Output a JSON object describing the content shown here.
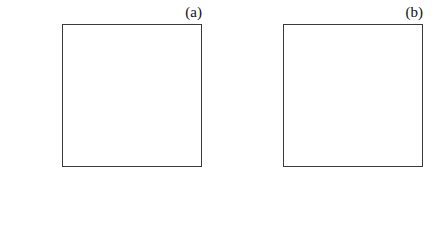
{
  "figure": {
    "background": "#ffffff",
    "line_color": "#2b2b2b",
    "axis_color": "#3a3a3a"
  },
  "chart_data": [
    {
      "id": "panel-a",
      "type": "line",
      "title": "(a)",
      "panel_label": "(a)",
      "xlabel": "Profit",
      "xlabel_sub": "2",
      "xlabel_symbol": "π",
      "ylabel": "Utility",
      "ylabel_symbol": "U",
      "ylabel_sub": "1",
      "xlim": [
        0,
        5
      ],
      "ylim": [
        -4,
        3
      ],
      "xticks": [
        "0",
        "1",
        "2",
        "3",
        "4",
        "5"
      ],
      "xtick_values": [
        0,
        1,
        2,
        3,
        4,
        5
      ],
      "yticks": [
        "3",
        "2",
        "1",
        "0",
        "-1",
        "-2",
        "-3",
        "-4"
      ],
      "ytick_values": [
        3,
        2,
        1,
        0,
        -1,
        -2,
        -3,
        -4
      ],
      "grid": false,
      "legend": "none",
      "markers": false,
      "series": [
        {
          "name": "solid",
          "style": "solid",
          "x": [
            0,
            0.5,
            5
          ],
          "values": [
            0.25,
            0.5,
            -4.0
          ]
        },
        {
          "name": "long-dash",
          "style": "long-dash",
          "x": [
            0,
            1,
            5
          ],
          "values": [
            0.6,
            1.0,
            -2.8
          ]
        },
        {
          "name": "short-dash",
          "style": "short-dash",
          "x": [
            0,
            2,
            5
          ],
          "values": [
            1.0,
            2.0,
            -1.0
          ]
        }
      ]
    },
    {
      "id": "panel-b",
      "type": "line",
      "title": "(b)",
      "panel_label": "(b)",
      "xlabel": "Profit",
      "xlabel_sub": "1",
      "xlabel_symbol": "π",
      "ylabel": "Utility",
      "ylabel_symbol": "U",
      "ylabel_sub": "1",
      "xlim": [
        0,
        4
      ],
      "ylim": [
        -4,
        6
      ],
      "xticks": [
        "0",
        "1",
        "2",
        "3",
        "4"
      ],
      "xtick_values": [
        0,
        1,
        2,
        3,
        4
      ],
      "yticks": [
        "6",
        "4",
        "2",
        "0",
        "-2",
        "-4"
      ],
      "ytick_values": [
        6,
        4,
        2,
        0,
        -2,
        -4
      ],
      "grid": false,
      "legend": "none",
      "markers": true,
      "series": [
        {
          "name": "solid-markers",
          "style": "solid",
          "marker": "filled-circle",
          "x": [
            0,
            1,
            2,
            3,
            4
          ],
          "values": [
            0,
            1,
            2,
            3,
            4
          ]
        },
        {
          "name": "solid-concave",
          "style": "solid",
          "marker": "none",
          "x": [
            0,
            1,
            2,
            3,
            4
          ],
          "values": [
            -0.5,
            0.85,
            1.5,
            1.95,
            2.2
          ]
        },
        {
          "name": "long-dash",
          "style": "long-dash",
          "marker": "none",
          "x": [
            0,
            1,
            2,
            3,
            4
          ],
          "values": [
            -1.0,
            0.6,
            1.55,
            2.05,
            2.45
          ]
        },
        {
          "name": "short-dash",
          "style": "short-dash",
          "marker": "none",
          "x": [
            0,
            1,
            2,
            3,
            4
          ],
          "values": [
            -2.0,
            0.2,
            2.0,
            2.6,
            3.0
          ]
        }
      ]
    }
  ]
}
